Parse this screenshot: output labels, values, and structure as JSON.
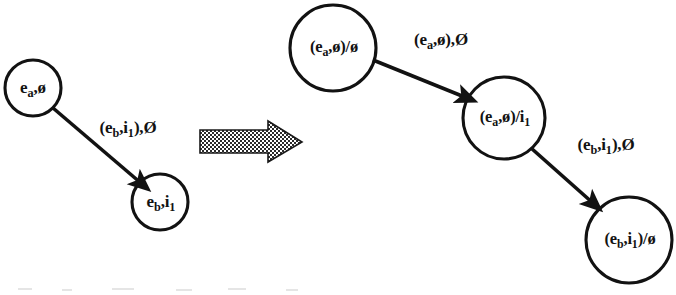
{
  "figure": {
    "caption": "",
    "background_color": "#ffffff",
    "ink_color": "#121212",
    "left_graph": {
      "name": "source-graph",
      "nodes": [
        {
          "id": "L1",
          "label": "e",
          "sub": "a",
          "tail": ",ø",
          "full_text": "eₐ,ø",
          "cx": 33,
          "cy": 88,
          "r": 28
        },
        {
          "id": "L2",
          "label": "e",
          "sub": "b",
          "tail": ",i",
          "sub2": "1",
          "full_text": "eb,i₁",
          "cx": 160,
          "cy": 202,
          "r": 28
        }
      ],
      "edges": [
        {
          "id": "LE1",
          "from": "L1",
          "to": "L2",
          "label_text": "(eb,i₁),Ø",
          "label_x": 128,
          "label_y": 129
        }
      ]
    },
    "transform_arrow": {
      "name": "transform-arrow",
      "style": "dithered-block-arrow",
      "x": 200,
      "y": 121,
      "width": 102,
      "height": 42
    },
    "right_graph": {
      "name": "result-graph",
      "nodes": [
        {
          "id": "R1",
          "full_text": "(eₐ,ø)/ø",
          "cx": 333,
          "cy": 48,
          "r": 43
        },
        {
          "id": "R2",
          "full_text": "(eₐ,ø)/i₁",
          "cx": 504,
          "cy": 118,
          "r": 41
        },
        {
          "id": "R3",
          "full_text": "(eb,i₁)/ø",
          "cx": 629,
          "cy": 240,
          "r": 43
        }
      ],
      "edges": [
        {
          "id": "RE1",
          "from": "R1",
          "to": "R2",
          "label_text": "(eₐ,ø),Ø",
          "label_x": 441,
          "label_y": 41
        },
        {
          "id": "RE2",
          "from": "R2",
          "to": "R3",
          "label_text": "(eb,i₁),Ø",
          "label_x": 606,
          "label_y": 146
        }
      ]
    }
  },
  "labels": {
    "left_node_1": "e",
    "left_node_1_sub": "a",
    "left_node_1_tail": ",ø",
    "left_node_2": "e",
    "left_node_2_sub": "b",
    "left_node_2_mid": ",i",
    "left_node_2_sub2": "1",
    "left_edge_pre": "(e",
    "left_edge_sub1": "b",
    "left_edge_mid": ",i",
    "left_edge_sub2": "1",
    "left_edge_post": "),Ø",
    "right_node_1_pre": "(e",
    "right_node_1_sub": "a",
    "right_node_1_post": ",ø)/ø",
    "right_node_2_pre": "(e",
    "right_node_2_sub": "a",
    "right_node_2_mid": ",ø)/i",
    "right_node_2_sub2": "1",
    "right_node_3_pre": "(e",
    "right_node_3_sub": "b",
    "right_node_3_mid": ",i",
    "right_node_3_sub2": "1",
    "right_node_3_post": ")/ø",
    "right_edge_1_pre": "(e",
    "right_edge_1_sub": "a",
    "right_edge_1_post": ",ø),Ø",
    "right_edge_2_pre": "(e",
    "right_edge_2_sub": "b",
    "right_edge_2_mid": ",i",
    "right_edge_2_sub2": "1",
    "right_edge_2_post": "),Ø"
  }
}
